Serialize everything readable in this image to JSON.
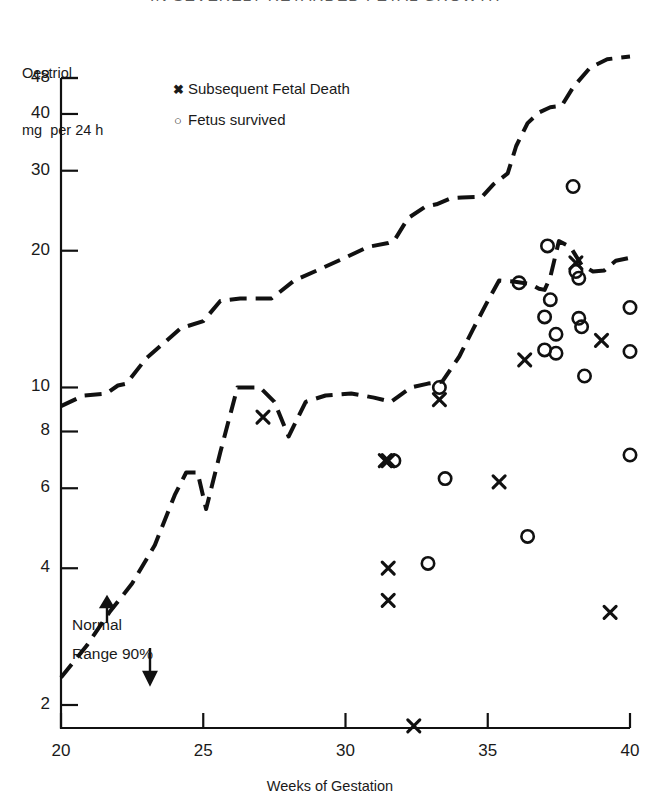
{
  "title_clipped": "IN SEVERELY RETARDED FETAL GROWTH",
  "axes": {
    "y_title_line1": "Oestriol",
    "y_title_line2": "mg  per 24 h",
    "x_title": "Weeks of Gestation",
    "y_ticks": [
      48,
      40,
      30,
      20,
      10,
      8,
      6,
      4,
      2
    ],
    "x_ticks": [
      20,
      25,
      30,
      35,
      40
    ]
  },
  "legend": {
    "position": "top-left-inside",
    "items": [
      {
        "marker": "x",
        "label": "Subsequent Fetal Death"
      },
      {
        "marker": "o",
        "label": "Fetus survived"
      }
    ]
  },
  "annotations": [
    {
      "name": "normal-range-label",
      "line1": "Normal",
      "line2": "Range 90%"
    }
  ],
  "chart_data": {
    "type": "scatter",
    "title": "IN SEVERELY RETARDED FETAL GROWTH",
    "xlabel": "Weeks of Gestation",
    "ylabel": "Oestriol mg per 24 h",
    "xlim": [
      20,
      40
    ],
    "ylim": [
      1.8,
      52
    ],
    "yscale": "log",
    "grid": false,
    "xticks": [
      20,
      25,
      30,
      35,
      40
    ],
    "yticks": [
      2,
      4,
      6,
      8,
      10,
      20,
      30,
      40,
      48
    ],
    "series": [
      {
        "name": "Subsequent Fetal Death",
        "marker": "x",
        "points": [
          [
            27.1,
            8.6
          ],
          [
            31.4,
            6.9
          ],
          [
            31.5,
            6.9
          ],
          [
            31.5,
            4.0
          ],
          [
            31.5,
            3.4
          ],
          [
            32.4,
            1.8
          ],
          [
            33.3,
            9.4
          ],
          [
            35.4,
            6.2
          ],
          [
            36.3,
            11.5
          ],
          [
            38.1,
            18.8
          ],
          [
            39.0,
            12.7
          ],
          [
            39.3,
            3.2
          ]
        ]
      },
      {
        "name": "Fetus survived",
        "marker": "o",
        "points": [
          [
            31.7,
            6.9
          ],
          [
            32.9,
            4.1
          ],
          [
            33.3,
            10.0
          ],
          [
            33.5,
            6.3
          ],
          [
            36.1,
            17.0
          ],
          [
            36.4,
            4.7
          ],
          [
            37.0,
            14.3
          ],
          [
            37.0,
            12.1
          ],
          [
            37.1,
            20.5
          ],
          [
            37.2,
            15.6
          ],
          [
            37.4,
            13.1
          ],
          [
            37.4,
            11.9
          ],
          [
            38.0,
            27.7
          ],
          [
            38.1,
            18.0
          ],
          [
            38.2,
            17.4
          ],
          [
            38.2,
            14.2
          ],
          [
            38.3,
            13.6
          ],
          [
            38.4,
            10.6
          ],
          [
            40.0,
            15.0
          ],
          [
            40.0,
            12.0
          ],
          [
            40.0,
            7.1
          ]
        ]
      },
      {
        "name": "Normal Range 90% upper limit",
        "marker": "dashed-line",
        "points": [
          [
            20.0,
            9.1
          ],
          [
            20.8,
            9.6
          ],
          [
            21.6,
            9.7
          ],
          [
            22.0,
            10.1
          ],
          [
            22.3,
            10.2
          ],
          [
            23.0,
            11.6
          ],
          [
            23.6,
            12.5
          ],
          [
            24.2,
            13.5
          ],
          [
            25.0,
            14.0
          ],
          [
            25.6,
            15.5
          ],
          [
            26.3,
            15.7
          ],
          [
            27.4,
            15.7
          ],
          [
            28.2,
            17.2
          ],
          [
            29.0,
            18.1
          ],
          [
            29.9,
            19.2
          ],
          [
            30.8,
            20.4
          ],
          [
            31.5,
            20.8
          ],
          [
            31.7,
            21.0
          ],
          [
            32.2,
            23.6
          ],
          [
            32.8,
            25.0
          ],
          [
            33.2,
            25.3
          ],
          [
            33.7,
            26.1
          ],
          [
            34.1,
            26.2
          ],
          [
            34.8,
            26.3
          ],
          [
            35.2,
            28.0
          ],
          [
            35.7,
            29.6
          ],
          [
            36.0,
            34.0
          ],
          [
            36.4,
            38.2
          ],
          [
            36.8,
            40.3
          ],
          [
            37.2,
            41.4
          ],
          [
            37.6,
            41.7
          ],
          [
            38.0,
            45.8
          ],
          [
            38.6,
            50.6
          ],
          [
            39.2,
            52.8
          ],
          [
            40.0,
            53.5
          ]
        ]
      },
      {
        "name": "Normal Range 90% lower limit",
        "marker": "dashed-line",
        "points": [
          [
            20.0,
            2.3
          ],
          [
            20.9,
            2.7
          ],
          [
            21.7,
            3.2
          ],
          [
            22.5,
            3.7
          ],
          [
            23.3,
            4.5
          ],
          [
            24.0,
            5.8
          ],
          [
            24.4,
            6.5
          ],
          [
            24.8,
            6.5
          ],
          [
            25.1,
            5.4
          ],
          [
            25.6,
            7.2
          ],
          [
            26.2,
            10.0
          ],
          [
            27.0,
            10.0
          ],
          [
            27.5,
            9.3
          ],
          [
            28.0,
            7.8
          ],
          [
            28.6,
            9.3
          ],
          [
            29.3,
            9.6
          ],
          [
            30.2,
            9.7
          ],
          [
            31.0,
            9.5
          ],
          [
            31.6,
            9.3
          ],
          [
            32.3,
            10.0
          ],
          [
            32.9,
            10.2
          ],
          [
            33.4,
            10.3
          ],
          [
            34.0,
            11.7
          ],
          [
            34.5,
            13.5
          ],
          [
            35.0,
            15.5
          ],
          [
            35.4,
            17.2
          ],
          [
            35.9,
            17.1
          ],
          [
            36.5,
            16.9
          ],
          [
            36.8,
            16.5
          ],
          [
            37.0,
            16.4
          ],
          [
            37.2,
            17.5
          ],
          [
            37.5,
            21.0
          ],
          [
            37.9,
            20.4
          ],
          [
            38.3,
            18.6
          ],
          [
            38.7,
            18.0
          ],
          [
            39.1,
            18.1
          ],
          [
            39.5,
            19.0
          ],
          [
            40.0,
            19.3
          ]
        ]
      }
    ]
  }
}
